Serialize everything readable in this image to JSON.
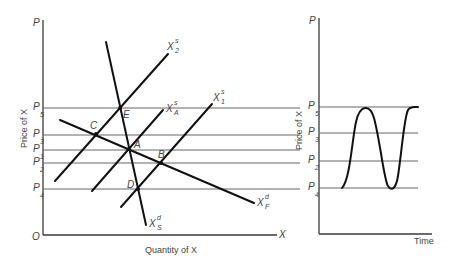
{
  "left_panel": {
    "y_axis_label": "P",
    "x_axis_label": "X",
    "origin_label": "O",
    "y_axis_title": "Price of X",
    "x_axis_title": "Quantity of X",
    "price_levels": [
      {
        "name": "P",
        "sub": "5"
      },
      {
        "name": "P",
        "sub": "3"
      },
      {
        "name": "P",
        "sub": "1"
      },
      {
        "name": "P",
        "sub": "2"
      },
      {
        "name": "P",
        "sub": "4"
      }
    ],
    "curves": [
      {
        "name": "X",
        "sup": "s",
        "sub": "2"
      },
      {
        "name": "X",
        "sup": "s",
        "sub": "A"
      },
      {
        "name": "X",
        "sup": "s",
        "sub": "1"
      },
      {
        "name": "X",
        "sup": "d",
        "sub": "F"
      },
      {
        "name": "X",
        "sup": "d",
        "sub": "S"
      }
    ],
    "points": [
      "E",
      "C",
      "A",
      "B",
      "D"
    ]
  },
  "right_panel": {
    "y_axis_label": "P",
    "y_axis_title": "Price of X",
    "x_axis_title": "Time",
    "price_levels": [
      {
        "name": "P",
        "sub": "5"
      },
      {
        "name": "P",
        "sub": "3"
      },
      {
        "name": "P",
        "sub": "2"
      },
      {
        "name": "P",
        "sub": "4"
      }
    ]
  }
}
